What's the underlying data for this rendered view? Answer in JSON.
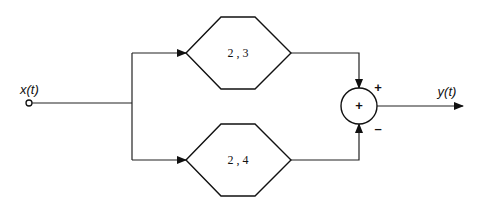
{
  "diagram": {
    "type": "block-diagram",
    "input": {
      "label": "x(t)"
    },
    "output": {
      "label": "y(t)"
    },
    "blocks": [
      {
        "id": "top",
        "label": "2 , 3",
        "shape": "hexagon"
      },
      {
        "id": "bottom",
        "label": "2 , 4",
        "shape": "hexagon"
      }
    ],
    "summer": {
      "center_symbol": "+",
      "input_signs": {
        "top": "+",
        "bottom": "–"
      }
    },
    "colors": {
      "stroke": "#111111",
      "background": "#ffffff"
    }
  }
}
